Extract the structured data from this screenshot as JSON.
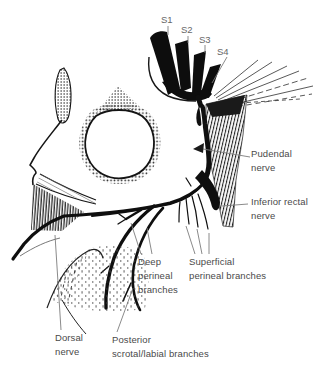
{
  "figure": {
    "type": "anatomical line diagram",
    "background": "#ffffff",
    "ink_color": "#141414",
    "label_color": "#4a4a4a",
    "leader_color": "#7d7d7d"
  },
  "root_labels": {
    "s1": "S1",
    "s2": "S2",
    "s3": "S3",
    "s4": "S4"
  },
  "labels": {
    "pudendal": {
      "line1": "Pudendal",
      "line2": "nerve"
    },
    "inferior_rectal": {
      "line1": "Inferior rectal",
      "line2": "nerve"
    },
    "deep_perineal": {
      "line1": "Deep",
      "line2": "perineal",
      "line3": "branches"
    },
    "superficial_perineal": {
      "line1": "Superficial",
      "line2": "perineal branches"
    },
    "dorsal": {
      "line1": "Dorsal",
      "line2": "nerve"
    },
    "posterior_scrotal": {
      "line1": "Posterior",
      "line2": "scrotal/labial branches"
    }
  }
}
